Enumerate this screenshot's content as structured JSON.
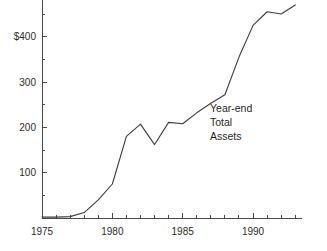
{
  "chart_data": {
    "type": "line",
    "title": "",
    "subtitle": "",
    "xlabel": "",
    "ylabel": "",
    "annotation": "Year-end Total Assets",
    "annotation_lines": [
      "Year-end",
      "Total",
      "Assets"
    ],
    "x": [
      1975,
      1976,
      1977,
      1978,
      1979,
      1980,
      1981,
      1982,
      1983,
      1984,
      1985,
      1986,
      1987,
      1988,
      1989,
      1990,
      1991,
      1992,
      1993
    ],
    "values": [
      2,
      2,
      3,
      12,
      40,
      75,
      180,
      207,
      162,
      211,
      208,
      232,
      253,
      272,
      355,
      425,
      455,
      450,
      470
    ],
    "series": [
      {
        "name": "Year-end Total Assets",
        "values": [
          2,
          2,
          3,
          12,
          40,
          75,
          180,
          207,
          162,
          211,
          208,
          232,
          253,
          272,
          355,
          425,
          455,
          450,
          470
        ]
      }
    ],
    "xlim": [
      1975,
      1993.5
    ],
    "ylim": [
      0,
      490
    ],
    "x_tick_labels": [
      "1975",
      "1980",
      "1985",
      "1990"
    ],
    "x_tick_values": [
      1975,
      1980,
      1985,
      1990
    ],
    "x_minor_tick_values": [
      1976,
      1977,
      1978,
      1979,
      1981,
      1982,
      1983,
      1984,
      1986,
      1987,
      1988,
      1989,
      1991,
      1992,
      1993
    ],
    "y_tick_labels": [
      "100",
      "200",
      "300",
      "$400"
    ],
    "y_tick_values": [
      100,
      200,
      300,
      400
    ],
    "y_minor_tick_values": [
      50,
      150,
      250,
      350,
      450
    ],
    "grid": false,
    "legend": null,
    "legend_position": "none",
    "line_color": "#3c3c3c",
    "axis_color": "#4a4a4a",
    "text_color": "#2b2b2b",
    "background_color": "#ffffff"
  }
}
